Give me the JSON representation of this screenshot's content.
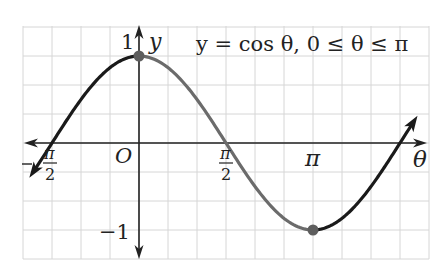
{
  "chart_data": {
    "type": "line",
    "title": "y = cos θ, 0 ≤ θ ≤ π",
    "function": "cos",
    "xlabel": "θ",
    "ylabel": "y",
    "origin_label": "O",
    "x_ticks": [
      {
        "value": -1.5708,
        "label_num": "π",
        "label_den": "2",
        "negative": true
      },
      {
        "value": 1.5708,
        "label_num": "π",
        "label_den": "2",
        "negative": false
      },
      {
        "value": 3.1416,
        "label": "π"
      }
    ],
    "y_ticks": [
      {
        "value": 1,
        "label": "1"
      },
      {
        "value": -1,
        "label": "−1"
      }
    ],
    "xlim": [
      -2.2,
      4.8
    ],
    "ylim": [
      -1.3,
      1.3
    ],
    "grid": true,
    "highlight_range": [
      0,
      3.1416
    ],
    "highlight_points": [
      {
        "x": 0,
        "y": 1
      },
      {
        "x": 3.1416,
        "y": -1
      }
    ],
    "series": [
      {
        "name": "cos θ (θ < 0)",
        "x_range": [
          -1.9,
          0
        ],
        "color": "#1a1a1a"
      },
      {
        "name": "cos θ, 0 ≤ θ ≤ π",
        "x_range": [
          0,
          3.1416
        ],
        "color": "#6b6b6b"
      },
      {
        "name": "cos θ (θ > π)",
        "x_range": [
          3.1416,
          4.95
        ],
        "color": "#1a1a1a"
      }
    ],
    "colors": {
      "grid": "#d6d6d6",
      "axis": "#222222",
      "curve_dark": "#1a1a1a",
      "curve_highlight": "#6b6b6b",
      "point": "#5e5e5e"
    }
  },
  "labels": {
    "equation": "y = cos θ, 0 ≤ θ ≤ π",
    "y_axis": "y",
    "x_axis": "θ",
    "origin": "O",
    "one": "1",
    "neg_one": "−1",
    "pi": "π",
    "two": "2",
    "minus": "−"
  }
}
